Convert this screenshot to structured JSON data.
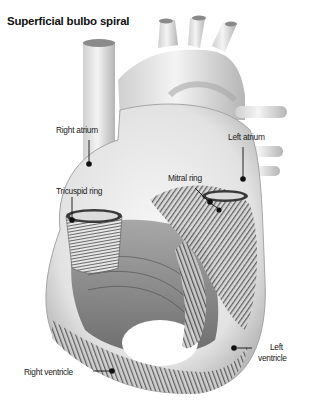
{
  "title": "Superficial bulbo spiral",
  "labels": {
    "right_atrium": "Right atrium",
    "left_atrium": "Left atrium",
    "tricuspid_ring": "Tricuspid ring",
    "mitral_ring": "Mitral ring",
    "left_ventricle_line1": "Left",
    "left_ventricle_line2": "ventricle",
    "right_ventricle": "Right ventricle"
  },
  "colors": {
    "background": "#ffffff",
    "heart_fill": "#e9e9e9",
    "heart_shade": "#bdbdbd",
    "muscle_dark": "#3a3a3a",
    "label_text": "#222222",
    "pointer": "#111111"
  }
}
